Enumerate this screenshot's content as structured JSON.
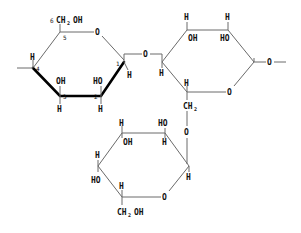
{
  "diagram": {
    "type": "haworth-projection",
    "ring1": {
      "c6_label": "CH",
      "c6_sub": "2",
      "c6_oh": "OH",
      "ring_o": "O",
      "glycosidic_o": "O",
      "numbers": [
        "6",
        "5",
        "4",
        "3",
        "2",
        "1"
      ],
      "c4_h": "H",
      "c3_oh": "OH",
      "c3_h": "H",
      "c2_ho": "HO",
      "c2_h": "H",
      "c1_h": "H"
    },
    "ring2": {
      "top_left_h": "H",
      "top_left_oh": "OH",
      "top_right_h": "H",
      "top_right_ho": "HO",
      "left_h": "H",
      "ring_o": "O",
      "right_o": "O",
      "bottom_h": "H",
      "ch2_label": "CH",
      "ch2_sub": "2"
    },
    "ring3": {
      "link_o": "O",
      "top_left_h": "H",
      "top_left_oh": "OH",
      "top_right_ho": "HO",
      "top_right_h": "H",
      "left_h": "H",
      "left_ho": "HO",
      "right_h": "H",
      "ring_o": "O",
      "bottom_h": "H",
      "c6_label": "CH",
      "c6_sub": "2",
      "c6_oh": "OH"
    }
  }
}
